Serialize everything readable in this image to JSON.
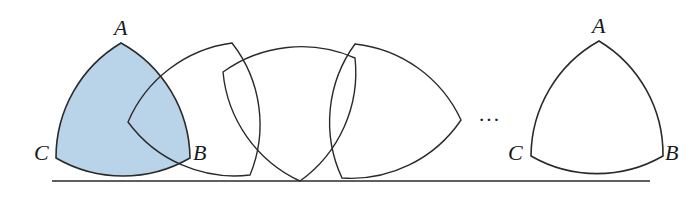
{
  "diagram": {
    "colors": {
      "fill_initial": "#b9d3e8",
      "stroke": "#2a2a2a",
      "background": "#ffffff"
    },
    "baseline": {
      "x1": 52,
      "x2": 650,
      "y": 181
    },
    "radius": 136,
    "shapes": [
      {
        "id": "initial",
        "filled": true,
        "vertices": [
          [
            121,
            43
          ],
          [
            190,
            158
          ],
          [
            56,
            158
          ]
        ]
      },
      {
        "id": "rolling-1",
        "filled": false,
        "vertices": [
          [
            232,
            43
          ],
          [
            250,
            175
          ],
          [
            128,
            122
          ]
        ]
      },
      {
        "id": "rolling-2",
        "filled": false,
        "vertices": [
          [
            355,
            58
          ],
          [
            300,
            181
          ],
          [
            223,
            72
          ]
        ]
      },
      {
        "id": "rolling-3",
        "filled": false,
        "vertices": [
          [
            461,
            120
          ],
          [
            342,
            178
          ],
          [
            355,
            44
          ]
        ]
      },
      {
        "id": "final",
        "filled": false,
        "vertices": [
          [
            599,
            41
          ],
          [
            663,
            156
          ],
          [
            531,
            156
          ]
        ]
      }
    ],
    "labels": {
      "initial": {
        "A": "A",
        "B": "B",
        "C": "C"
      },
      "final": {
        "A": "A",
        "B": "B",
        "C": "C"
      }
    },
    "ellipsis": "···"
  }
}
